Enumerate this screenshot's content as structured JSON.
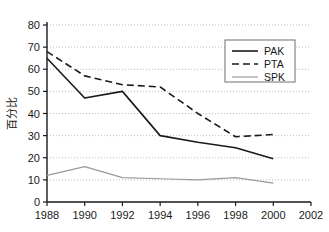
{
  "chart_data": {
    "type": "line",
    "title": "",
    "xlabel": "",
    "ylabel": "百分比",
    "x": [
      1988,
      1990,
      1992,
      1994,
      1996,
      1998,
      2000
    ],
    "xticks": [
      "1988",
      "1990",
      "1992",
      "1994",
      "1996",
      "1998",
      "2000",
      "2002"
    ],
    "xlim": [
      1988,
      2002
    ],
    "yticks": [
      "0",
      "10",
      "20",
      "30",
      "40",
      "50",
      "60",
      "70",
      "80"
    ],
    "ylim": [
      0,
      80
    ],
    "grid": true,
    "legend_position": "top-right",
    "series": [
      {
        "name": "PAK",
        "style": "solid",
        "color": "#1a1a1a",
        "values": [
          65,
          47,
          50,
          30,
          27,
          24.5,
          19.5
        ]
      },
      {
        "name": "PTA",
        "style": "dashed",
        "color": "#1a1a1a",
        "values": [
          68,
          57,
          53,
          52,
          40,
          29.5,
          30.5
        ]
      },
      {
        "name": "SPK",
        "style": "solid",
        "color": "#9a9a9a",
        "values": [
          12,
          16,
          11,
          10.5,
          10,
          11,
          8.5
        ]
      }
    ]
  },
  "axes": {
    "y_axis_title": "百分比"
  },
  "legend": {
    "entries": [
      {
        "label": "PAK"
      },
      {
        "label": "PTA"
      },
      {
        "label": "SPK"
      }
    ]
  }
}
